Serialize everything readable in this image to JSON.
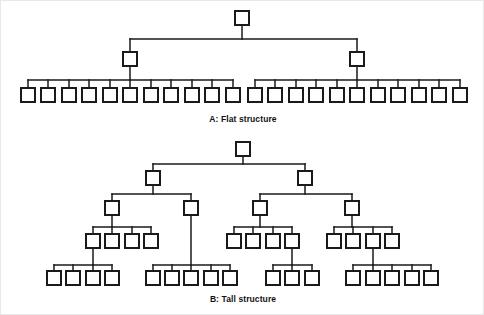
{
  "figure": {
    "background_color": "#ffffff",
    "line_color": "#1a1a1a",
    "box_fill": "#ffffff",
    "frame_color": "#e8e8e8",
    "box_size": 14,
    "panels": [
      {
        "id": "panel-a",
        "caption": "A: Flat structure",
        "caption_x": 242,
        "caption_y": 121,
        "levels": 3,
        "nodes": [
          {
            "id": "a-root",
            "level": 1,
            "x": 241,
            "y": 17
          },
          {
            "id": "a-l2-1",
            "level": 2,
            "x": 129,
            "y": 58
          },
          {
            "id": "a-l2-2",
            "level": 2,
            "x": 356,
            "y": 58
          },
          {
            "id": "a-l3-1",
            "level": 3,
            "x": 27,
            "y": 94,
            "parent": "a-l2-1"
          },
          {
            "id": "a-l3-2",
            "level": 3,
            "x": 47,
            "y": 94,
            "parent": "a-l2-1"
          },
          {
            "id": "a-l3-3",
            "level": 3,
            "x": 68,
            "y": 94,
            "parent": "a-l2-1"
          },
          {
            "id": "a-l3-4",
            "level": 3,
            "x": 88,
            "y": 94,
            "parent": "a-l2-1"
          },
          {
            "id": "a-l3-5",
            "level": 3,
            "x": 109,
            "y": 94,
            "parent": "a-l2-1"
          },
          {
            "id": "a-l3-6",
            "level": 3,
            "x": 129,
            "y": 94,
            "parent": "a-l2-1"
          },
          {
            "id": "a-l3-7",
            "level": 3,
            "x": 150,
            "y": 94,
            "parent": "a-l2-1"
          },
          {
            "id": "a-l3-8",
            "level": 3,
            "x": 170,
            "y": 94,
            "parent": "a-l2-1"
          },
          {
            "id": "a-l3-9",
            "level": 3,
            "x": 191,
            "y": 94,
            "parent": "a-l2-1"
          },
          {
            "id": "a-l3-10",
            "level": 3,
            "x": 211,
            "y": 94,
            "parent": "a-l2-1"
          },
          {
            "id": "a-l3-11",
            "level": 3,
            "x": 232,
            "y": 94,
            "parent": "a-l2-1"
          },
          {
            "id": "a-l3-12",
            "level": 3,
            "x": 254,
            "y": 94,
            "parent": "a-l2-2"
          },
          {
            "id": "a-l3-13",
            "level": 3,
            "x": 274,
            "y": 94,
            "parent": "a-l2-2"
          },
          {
            "id": "a-l3-14",
            "level": 3,
            "x": 295,
            "y": 94,
            "parent": "a-l2-2"
          },
          {
            "id": "a-l3-15",
            "level": 3,
            "x": 315,
            "y": 94,
            "parent": "a-l2-2"
          },
          {
            "id": "a-l3-16",
            "level": 3,
            "x": 336,
            "y": 94,
            "parent": "a-l2-2"
          },
          {
            "id": "a-l3-17",
            "level": 3,
            "x": 356,
            "y": 94,
            "parent": "a-l2-2"
          },
          {
            "id": "a-l3-18",
            "level": 3,
            "x": 377,
            "y": 94,
            "parent": "a-l2-2"
          },
          {
            "id": "a-l3-19",
            "level": 3,
            "x": 397,
            "y": 94,
            "parent": "a-l2-2"
          },
          {
            "id": "a-l3-20",
            "level": 3,
            "x": 418,
            "y": 94,
            "parent": "a-l2-2"
          },
          {
            "id": "a-l3-21",
            "level": 3,
            "x": 438,
            "y": 94,
            "parent": "a-l2-2"
          },
          {
            "id": "a-l3-22",
            "level": 3,
            "x": 459,
            "y": 94,
            "parent": "a-l2-2"
          }
        ],
        "groups": [
          {
            "parent": "a-root",
            "children": [
              "a-l2-1",
              "a-l2-2"
            ],
            "bus_y": 38
          },
          {
            "parent": "a-l2-1",
            "children": [
              "a-l3-1",
              "a-l3-2",
              "a-l3-3",
              "a-l3-4",
              "a-l3-5",
              "a-l3-6",
              "a-l3-7",
              "a-l3-8",
              "a-l3-9",
              "a-l3-10",
              "a-l3-11"
            ],
            "bus_y": 79
          },
          {
            "parent": "a-l2-2",
            "children": [
              "a-l3-12",
              "a-l3-13",
              "a-l3-14",
              "a-l3-15",
              "a-l3-16",
              "a-l3-17",
              "a-l3-18",
              "a-l3-19",
              "a-l3-20",
              "a-l3-21",
              "a-l3-22"
            ],
            "bus_y": 79
          }
        ],
        "counts": {
          "level1": 1,
          "level2": 2,
          "level3": 22,
          "span_per_manager": 11
        }
      },
      {
        "id": "panel-b",
        "caption": "B: Tall structure",
        "caption_x": 242,
        "caption_y": 301,
        "levels": 5,
        "nodes": [
          {
            "id": "b-root",
            "level": 1,
            "x": 242,
            "y": 148
          },
          {
            "id": "b-l2-1",
            "level": 2,
            "x": 152,
            "y": 177
          },
          {
            "id": "b-l2-2",
            "level": 2,
            "x": 304,
            "y": 177
          },
          {
            "id": "b-l3-1",
            "level": 3,
            "x": 111,
            "y": 207,
            "parent": "b-l2-1"
          },
          {
            "id": "b-l3-2",
            "level": 3,
            "x": 190,
            "y": 207,
            "parent": "b-l2-1"
          },
          {
            "id": "b-l3-3",
            "level": 3,
            "x": 259,
            "y": 207,
            "parent": "b-l2-2"
          },
          {
            "id": "b-l3-4",
            "level": 3,
            "x": 351,
            "y": 207,
            "parent": "b-l2-2"
          },
          {
            "id": "b-l4-1",
            "level": 4,
            "x": 92,
            "y": 240,
            "parent": "b-l3-1"
          },
          {
            "id": "b-l4-2",
            "level": 4,
            "x": 111,
            "y": 240,
            "parent": "b-l3-1"
          },
          {
            "id": "b-l4-3",
            "level": 4,
            "x": 131,
            "y": 240,
            "parent": "b-l3-1"
          },
          {
            "id": "b-l4-4",
            "level": 4,
            "x": 150,
            "y": 240,
            "parent": "b-l3-1"
          },
          {
            "id": "b-l4-5",
            "level": 4,
            "x": 233,
            "y": 240,
            "parent": "b-l3-3"
          },
          {
            "id": "b-l4-6",
            "level": 4,
            "x": 252,
            "y": 240,
            "parent": "b-l3-3"
          },
          {
            "id": "b-l4-7",
            "level": 4,
            "x": 272,
            "y": 240,
            "parent": "b-l3-3"
          },
          {
            "id": "b-l4-8",
            "level": 4,
            "x": 291,
            "y": 240,
            "parent": "b-l3-3"
          },
          {
            "id": "b-l4-9",
            "level": 4,
            "x": 333,
            "y": 240,
            "parent": "b-l3-4"
          },
          {
            "id": "b-l4-10",
            "level": 4,
            "x": 352,
            "y": 240,
            "parent": "b-l3-4"
          },
          {
            "id": "b-l4-11",
            "level": 4,
            "x": 372,
            "y": 240,
            "parent": "b-l3-4"
          },
          {
            "id": "b-l4-12",
            "level": 4,
            "x": 391,
            "y": 240,
            "parent": "b-l3-4"
          },
          {
            "id": "b-l5-1",
            "level": 5,
            "x": 53,
            "y": 277,
            "parent": "b-l4-1"
          },
          {
            "id": "b-l5-2",
            "level": 5,
            "x": 72,
            "y": 277,
            "parent": "b-l4-1"
          },
          {
            "id": "b-l5-3",
            "level": 5,
            "x": 92,
            "y": 277,
            "parent": "b-l4-1"
          },
          {
            "id": "b-l5-4",
            "level": 5,
            "x": 111,
            "y": 277,
            "parent": "b-l4-1"
          },
          {
            "id": "b-l5-5",
            "level": 5,
            "x": 152,
            "y": 277,
            "parent": "b-l3-2"
          },
          {
            "id": "b-l5-6",
            "level": 5,
            "x": 171,
            "y": 277,
            "parent": "b-l3-2"
          },
          {
            "id": "b-l5-7",
            "level": 5,
            "x": 190,
            "y": 277,
            "parent": "b-l3-2"
          },
          {
            "id": "b-l5-8",
            "level": 5,
            "x": 210,
            "y": 277,
            "parent": "b-l3-2"
          },
          {
            "id": "b-l5-9",
            "level": 5,
            "x": 229,
            "y": 277,
            "parent": "b-l3-2"
          },
          {
            "id": "b-l5-10",
            "level": 5,
            "x": 272,
            "y": 277,
            "parent": "b-l4-8"
          },
          {
            "id": "b-l5-11",
            "level": 5,
            "x": 291,
            "y": 277,
            "parent": "b-l4-8"
          },
          {
            "id": "b-l5-12",
            "level": 5,
            "x": 311,
            "y": 277,
            "parent": "b-l4-8"
          },
          {
            "id": "b-l5-13",
            "level": 5,
            "x": 352,
            "y": 277,
            "parent": "b-l4-11"
          },
          {
            "id": "b-l5-14",
            "level": 5,
            "x": 372,
            "y": 277,
            "parent": "b-l4-11"
          },
          {
            "id": "b-l5-15",
            "level": 5,
            "x": 391,
            "y": 277,
            "parent": "b-l4-11"
          },
          {
            "id": "b-l5-16",
            "level": 5,
            "x": 411,
            "y": 277,
            "parent": "b-l4-11"
          },
          {
            "id": "b-l5-17",
            "level": 5,
            "x": 430,
            "y": 277,
            "parent": "b-l4-11"
          }
        ],
        "groups": [
          {
            "parent": "b-root",
            "children": [
              "b-l2-1",
              "b-l2-2"
            ],
            "bus_y": 163
          },
          {
            "parent": "b-l2-1",
            "children": [
              "b-l3-1",
              "b-l3-2"
            ],
            "bus_y": 193
          },
          {
            "parent": "b-l2-2",
            "children": [
              "b-l3-3",
              "b-l3-4"
            ],
            "bus_y": 193
          },
          {
            "parent": "b-l3-1",
            "children": [
              "b-l4-1",
              "b-l4-2",
              "b-l4-3",
              "b-l4-4"
            ],
            "bus_y": 226
          },
          {
            "parent": "b-l3-3",
            "children": [
              "b-l4-5",
              "b-l4-6",
              "b-l4-7",
              "b-l4-8"
            ],
            "bus_y": 226
          },
          {
            "parent": "b-l3-4",
            "children": [
              "b-l4-9",
              "b-l4-10",
              "b-l4-11",
              "b-l4-12"
            ],
            "bus_y": 226
          },
          {
            "parent": "b-l4-1",
            "children": [
              "b-l5-1",
              "b-l5-2",
              "b-l5-3",
              "b-l5-4"
            ],
            "bus_y": 264
          },
          {
            "parent": "b-l3-2",
            "children": [
              "b-l5-5",
              "b-l5-6",
              "b-l5-7",
              "b-l5-8",
              "b-l5-9"
            ],
            "bus_y": 264
          },
          {
            "parent": "b-l4-8",
            "children": [
              "b-l5-10",
              "b-l5-11",
              "b-l5-12"
            ],
            "bus_y": 264
          },
          {
            "parent": "b-l4-11",
            "children": [
              "b-l5-13",
              "b-l5-14",
              "b-l5-15",
              "b-l5-16",
              "b-l5-17"
            ],
            "bus_y": 264
          }
        ],
        "counts": {
          "level1": 1,
          "level2": 2,
          "level3": 4,
          "level4": 12,
          "level5": 17
        }
      }
    ]
  }
}
